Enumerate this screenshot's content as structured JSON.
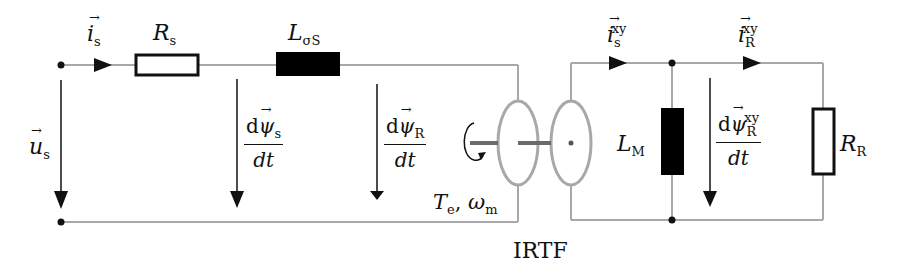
{
  "diagram": {
    "type": "equivalent circuit",
    "colors": {
      "wire": "#a8a8a8",
      "ink": "#111111",
      "component_fill_inductor": "#000000",
      "component_fill_resistor": "#ffffff"
    },
    "stator_side": {
      "current_label": {
        "symbol": "i",
        "vector": true,
        "sub": "s"
      },
      "voltage_label": {
        "symbol": "u",
        "vector": true,
        "sub": "s"
      },
      "resistor": {
        "symbol": "R",
        "sub": "s"
      },
      "leakage_inductor": {
        "symbol": "L",
        "sub": "σS"
      },
      "stator_flux_derivative": {
        "num_d": "d",
        "num_symbol": "ψ",
        "num_sub": "s",
        "den": "dt"
      },
      "rotor_flux_derivative": {
        "num_d": "d",
        "num_symbol": "ψ",
        "num_sub": "R",
        "den": "dt"
      }
    },
    "transformer": {
      "label": "IRTF",
      "torque_speed_label": {
        "torque_symbol": "T",
        "torque_sub": "e",
        "separator": ",",
        "speed_symbol": "ω",
        "speed_sub": "m"
      }
    },
    "rotor_side": {
      "stator_current_xy": {
        "symbol": "i",
        "vector": true,
        "sub": "s",
        "sup": "xy"
      },
      "rotor_current_xy": {
        "symbol": "i",
        "vector": true,
        "sub": "R",
        "sup": "xy"
      },
      "magnetizing_inductor": {
        "symbol": "L",
        "sub": "M"
      },
      "rotor_resistor": {
        "symbol": "R",
        "sub": "R"
      },
      "rotor_flux_xy_derivative": {
        "num_d": "d",
        "num_symbol": "ψ",
        "num_sub": "R",
        "num_sup": "xy",
        "den": "dt"
      }
    }
  }
}
